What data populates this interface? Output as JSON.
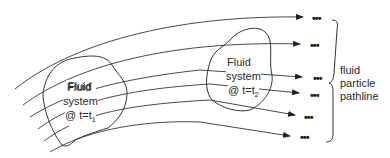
{
  "diagram": {
    "system_t1": {
      "line1": "Fluid",
      "line2": "system",
      "line3": "@ t=t",
      "sub": "1"
    },
    "system_t2": {
      "line1": "Fluid",
      "line2": "system",
      "line3": "@ t=t",
      "sub": "2"
    },
    "brace_label": {
      "line1": "fluid",
      "line2": "particle",
      "line3": "pathline"
    },
    "continuation": "•••",
    "pathline_count": 6,
    "stroke_color": "#333333"
  }
}
